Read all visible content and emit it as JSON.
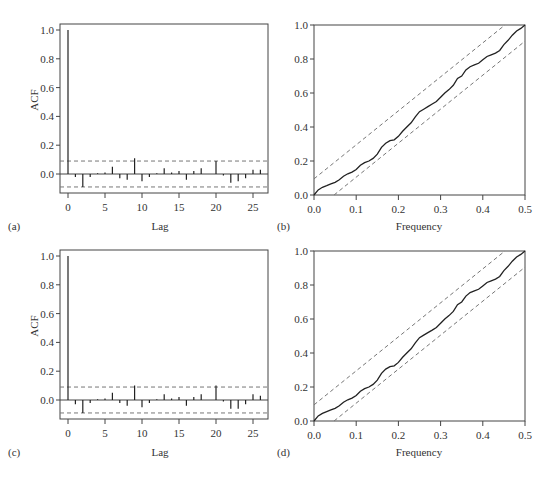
{
  "chart_data": [
    {
      "id": "a",
      "panel_label": "(a)",
      "type": "bar",
      "subtype": "acf-stem",
      "xlabel": "Lag",
      "ylabel": "ACF",
      "xticks": [
        0,
        5,
        10,
        15,
        20,
        25
      ],
      "yticks": [
        0.0,
        0.2,
        0.4,
        0.6,
        0.8,
        1.0
      ],
      "ytick_labels": [
        "0.0",
        "0.2",
        "0.4",
        "0.6",
        "0.8",
        "1.0"
      ],
      "xlim": [
        -1,
        27
      ],
      "ylim": [
        -0.14,
        1.04
      ],
      "confidence_band": 0.09,
      "lags": [
        0,
        1,
        2,
        3,
        4,
        5,
        6,
        7,
        8,
        9,
        10,
        11,
        12,
        13,
        14,
        15,
        16,
        17,
        18,
        19,
        20,
        21,
        22,
        23,
        24,
        25,
        26
      ],
      "values": [
        1.0,
        -0.02,
        -0.09,
        -0.02,
        0.005,
        0.01,
        0.05,
        -0.03,
        -0.04,
        0.11,
        -0.05,
        -0.02,
        0.005,
        0.04,
        0.01,
        0.02,
        -0.04,
        0.02,
        0.04,
        0.0,
        0.09,
        -0.01,
        -0.06,
        -0.05,
        -0.03,
        0.03,
        0.03
      ]
    },
    {
      "id": "b",
      "panel_label": "(b)",
      "type": "line",
      "subtype": "cumulative-periodogram",
      "xlabel": "Frequency",
      "ylabel": "",
      "xticks": [
        0.0,
        0.1,
        0.2,
        0.3,
        0.4,
        0.5
      ],
      "xtick_labels": [
        "0.0",
        "0.1",
        "0.2",
        "0.3",
        "0.4",
        "0.5"
      ],
      "yticks": [
        0.0,
        0.2,
        0.4,
        0.6,
        0.8,
        1.0
      ],
      "ytick_labels": [
        "0.0",
        "0.2",
        "0.4",
        "0.6",
        "0.8",
        "1.0"
      ],
      "xlim": [
        0,
        0.5
      ],
      "ylim": [
        0,
        1
      ],
      "band_offset": 0.095,
      "x": [
        0.0,
        0.01,
        0.02,
        0.03,
        0.04,
        0.05,
        0.06,
        0.07,
        0.08,
        0.09,
        0.1,
        0.11,
        0.12,
        0.13,
        0.14,
        0.15,
        0.16,
        0.17,
        0.18,
        0.19,
        0.2,
        0.21,
        0.22,
        0.23,
        0.24,
        0.25,
        0.26,
        0.27,
        0.28,
        0.29,
        0.3,
        0.31,
        0.32,
        0.33,
        0.34,
        0.35,
        0.36,
        0.37,
        0.38,
        0.39,
        0.4,
        0.41,
        0.42,
        0.43,
        0.44,
        0.45,
        0.46,
        0.47,
        0.48,
        0.49,
        0.5
      ],
      "values": [
        0.0,
        0.03,
        0.045,
        0.055,
        0.065,
        0.075,
        0.09,
        0.11,
        0.125,
        0.135,
        0.15,
        0.175,
        0.19,
        0.2,
        0.215,
        0.24,
        0.28,
        0.305,
        0.32,
        0.325,
        0.345,
        0.375,
        0.4,
        0.425,
        0.46,
        0.49,
        0.505,
        0.52,
        0.535,
        0.55,
        0.575,
        0.6,
        0.62,
        0.645,
        0.685,
        0.7,
        0.735,
        0.755,
        0.765,
        0.775,
        0.795,
        0.815,
        0.825,
        0.835,
        0.85,
        0.885,
        0.91,
        0.94,
        0.965,
        0.98,
        1.0
      ]
    },
    {
      "id": "c",
      "panel_label": "(c)",
      "type": "bar",
      "subtype": "acf-stem",
      "xlabel": "Lag",
      "ylabel": "ACF",
      "xticks": [
        0,
        5,
        10,
        15,
        20,
        25
      ],
      "yticks": [
        0.0,
        0.2,
        0.4,
        0.6,
        0.8,
        1.0
      ],
      "ytick_labels": [
        "0.0",
        "0.2",
        "0.4",
        "0.6",
        "0.8",
        "1.0"
      ],
      "xlim": [
        -1,
        27
      ],
      "ylim": [
        -0.14,
        1.04
      ],
      "confidence_band": 0.09,
      "lags": [
        0,
        1,
        2,
        3,
        4,
        5,
        6,
        7,
        8,
        9,
        10,
        11,
        12,
        13,
        14,
        15,
        16,
        17,
        18,
        19,
        20,
        21,
        22,
        23,
        24,
        25,
        26
      ],
      "values": [
        1.0,
        -0.03,
        -0.09,
        -0.02,
        0.005,
        0.01,
        0.05,
        -0.02,
        -0.04,
        0.1,
        -0.05,
        -0.02,
        0.005,
        0.04,
        0.01,
        0.02,
        -0.04,
        0.02,
        0.04,
        0.0,
        0.1,
        -0.01,
        -0.06,
        -0.06,
        -0.03,
        0.04,
        0.03
      ]
    },
    {
      "id": "d",
      "panel_label": "(d)",
      "type": "line",
      "subtype": "cumulative-periodogram",
      "xlabel": "Frequency",
      "ylabel": "",
      "xticks": [
        0.0,
        0.1,
        0.2,
        0.3,
        0.4,
        0.5
      ],
      "xtick_labels": [
        "0.0",
        "0.1",
        "0.2",
        "0.3",
        "0.4",
        "0.5"
      ],
      "yticks": [
        0.0,
        0.2,
        0.4,
        0.6,
        0.8,
        1.0
      ],
      "ytick_labels": [
        "0.0",
        "0.2",
        "0.4",
        "0.6",
        "0.8",
        "1.0"
      ],
      "xlim": [
        0,
        0.5
      ],
      "ylim": [
        0,
        1
      ],
      "band_offset": 0.095,
      "x": [
        0.0,
        0.01,
        0.02,
        0.03,
        0.04,
        0.05,
        0.06,
        0.07,
        0.08,
        0.09,
        0.1,
        0.11,
        0.12,
        0.13,
        0.14,
        0.15,
        0.16,
        0.17,
        0.18,
        0.19,
        0.2,
        0.21,
        0.22,
        0.23,
        0.24,
        0.25,
        0.26,
        0.27,
        0.28,
        0.29,
        0.3,
        0.31,
        0.32,
        0.33,
        0.34,
        0.35,
        0.36,
        0.37,
        0.38,
        0.39,
        0.4,
        0.41,
        0.42,
        0.43,
        0.44,
        0.45,
        0.46,
        0.47,
        0.48,
        0.49,
        0.5
      ],
      "values": [
        0.0,
        0.03,
        0.045,
        0.055,
        0.065,
        0.075,
        0.09,
        0.11,
        0.125,
        0.135,
        0.15,
        0.175,
        0.19,
        0.2,
        0.215,
        0.24,
        0.28,
        0.305,
        0.32,
        0.325,
        0.345,
        0.375,
        0.4,
        0.425,
        0.46,
        0.49,
        0.505,
        0.52,
        0.535,
        0.55,
        0.575,
        0.6,
        0.62,
        0.645,
        0.685,
        0.7,
        0.735,
        0.755,
        0.765,
        0.775,
        0.795,
        0.815,
        0.825,
        0.835,
        0.85,
        0.885,
        0.91,
        0.94,
        0.965,
        0.98,
        1.0
      ]
    }
  ],
  "layout": {
    "panels": [
      {
        "left": 60,
        "top": 24,
        "right": 268,
        "bottom": 193,
        "y0px": 174,
        "y1px": 30,
        "x0px": 68,
        "xstep": 7.4,
        "tag_x": 8,
        "tag_y": 230,
        "xlabel_x": 160,
        "xlabel_y": 230,
        "ylabel_x": 38,
        "ylabel_y": 100
      },
      {
        "left": 314,
        "top": 25,
        "right": 525,
        "bottom": 195,
        "tag_x": 277,
        "tag_y": 230,
        "xlabel_x": 419,
        "xlabel_y": 230
      },
      {
        "left": 60,
        "top": 250,
        "right": 268,
        "bottom": 419,
        "y0px": 400,
        "y1px": 256,
        "x0px": 68,
        "xstep": 7.4,
        "tag_x": 8,
        "tag_y": 456,
        "xlabel_x": 160,
        "xlabel_y": 456,
        "ylabel_x": 38,
        "ylabel_y": 326
      },
      {
        "left": 314,
        "top": 251,
        "right": 525,
        "bottom": 421,
        "tag_x": 277,
        "tag_y": 456,
        "xlabel_x": 419,
        "xlabel_y": 456
      }
    ],
    "colors": {
      "axis": "#444444",
      "line": "#222222",
      "dash": "#777777",
      "text": "#333333"
    }
  }
}
